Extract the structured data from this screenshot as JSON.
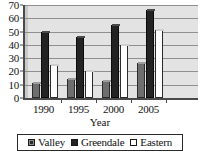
{
  "chart_data": {
    "type": "bar",
    "title": "",
    "xlabel": "Year",
    "ylabel": "",
    "categories": [
      "1990",
      "1995",
      "2000",
      "2005"
    ],
    "series": [
      {
        "name": "Valley",
        "values": [
          11,
          14,
          13,
          26
        ],
        "color": "#6e6e6e"
      },
      {
        "name": "Greendale",
        "values": [
          50,
          46,
          55,
          66
        ],
        "color": "#232323"
      },
      {
        "name": "Eastern",
        "values": [
          25,
          20,
          40,
          51
        ],
        "color": "#ffffff"
      }
    ],
    "ylim": [
      0,
      70
    ],
    "yticks": [
      0,
      10,
      20,
      30,
      40,
      50,
      60,
      70
    ],
    "ytick_labels": [
      "0",
      "10",
      "20",
      "30",
      "40",
      "50",
      "60",
      "70"
    ],
    "grid": true,
    "legend_position": "bottom",
    "legend_entries": [
      "Valley",
      "Greendale",
      "Eastern"
    ],
    "plot_background": "#e3e3e3",
    "axis_color": "#4a4a4a"
  },
  "axis": {
    "x_title": "Year"
  },
  "legend": {
    "items": [
      {
        "label": "Valley"
      },
      {
        "label": "Greendale"
      },
      {
        "label": "Eastern"
      }
    ]
  }
}
